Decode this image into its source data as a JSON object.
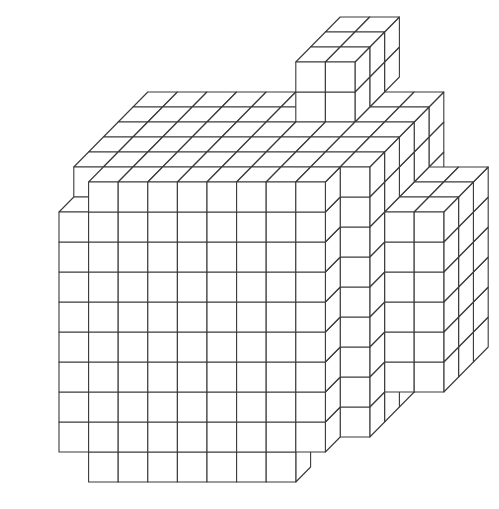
{
  "figure": {
    "stroke_color": "#3a3a3a",
    "fill_color": "#ffffff",
    "background": "#ffffff"
  },
  "projection": {
    "origin_x": 59,
    "origin_y": 482,
    "unit_x": 29.6,
    "unit_y": 30,
    "depth_dx": 14.8,
    "depth_dy": -15
  },
  "blocks": [
    {
      "name": "main-block",
      "x": [
        1,
        9
      ],
      "y": [
        1,
        10
      ],
      "z": [
        0,
        6
      ]
    },
    {
      "name": "main-front-left-column",
      "x": [
        0,
        1
      ],
      "y": [
        1,
        9
      ],
      "z": [
        0,
        6
      ]
    },
    {
      "name": "main-front-left-step",
      "x": [
        0,
        1
      ],
      "y": [
        9,
        10
      ],
      "z": [
        1,
        6
      ]
    },
    {
      "name": "main-bottom-row",
      "x": [
        1,
        8
      ],
      "y": [
        0,
        1
      ],
      "z": [
        0,
        1
      ]
    },
    {
      "name": "main-bottom-lower-left",
      "x": [
        1,
        2
      ],
      "y": [
        0,
        1
      ],
      "z": [
        0,
        1
      ]
    },
    {
      "name": "main-back-layers",
      "x": [
        1,
        10
      ],
      "y": [
        1,
        10
      ],
      "z": [
        1,
        6
      ]
    },
    {
      "name": "top-tower",
      "x": [
        6,
        8
      ],
      "y": [
        10,
        12
      ],
      "z": [
        4,
        7
      ]
    },
    {
      "name": "right-wing",
      "x": [
        10,
        12
      ],
      "y": [
        2,
        8
      ],
      "z": [
        2,
        5
      ]
    }
  ],
  "voxel_count_hint": "composed of unit cubes"
}
